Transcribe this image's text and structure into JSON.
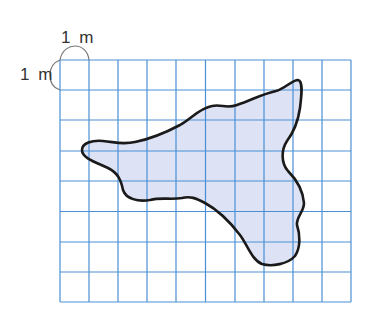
{
  "diagram": {
    "type": "area-estimation-grid",
    "grid": {
      "columns": 10,
      "rows": 8,
      "cell_size_label": "1 m",
      "line_color": "#4a8fd6"
    },
    "labels": {
      "top_unit": "1 m",
      "left_unit": "1 m"
    },
    "shape": {
      "fill_color": "#dde2f4",
      "stroke_color": "#1a1a1a",
      "description": "irregular blob shape"
    }
  }
}
